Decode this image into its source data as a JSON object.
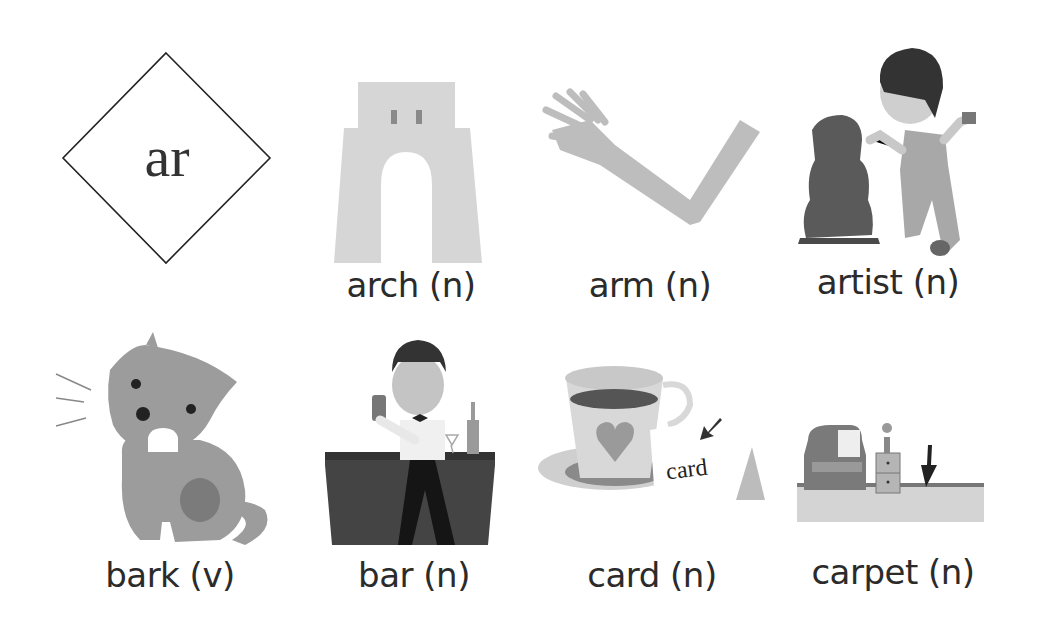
{
  "title": {
    "phonics_sound": "ar"
  },
  "words": [
    {
      "word": "arch",
      "pos": "(n)",
      "label": "arch (n)",
      "picture": "arch-picture"
    },
    {
      "word": "arm",
      "pos": "(n)",
      "label": "arm (n)",
      "picture": "arm-picture"
    },
    {
      "word": "artist",
      "pos": "(n)",
      "label": "artist (n)",
      "picture": "artist-picture"
    },
    {
      "word": "bark",
      "pos": "(v)",
      "label": "bark (v)",
      "picture": "dog-barking-picture"
    },
    {
      "word": "bar",
      "pos": "(n)",
      "label": "bar (n)",
      "picture": "bartender-picture"
    },
    {
      "word": "card",
      "pos": "(n)",
      "label": "card (n)",
      "picture": "teacup-card-picture",
      "inline_text": "card"
    },
    {
      "word": "carpet",
      "pos": "(n)",
      "label": "carpet (n)",
      "picture": "carpet-room-picture"
    }
  ],
  "colors": {
    "text": "#2b2b2b",
    "light_gray": "#d4d4d4",
    "mid_gray": "#9a9a9a",
    "dark_gray": "#555555",
    "black": "#1a1a1a"
  }
}
